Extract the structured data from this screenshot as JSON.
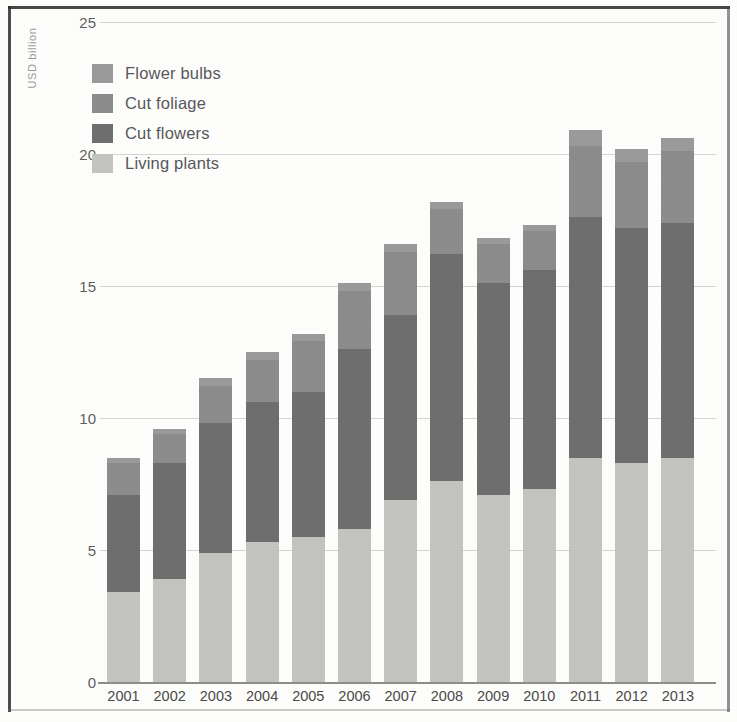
{
  "chart_data": {
    "type": "bar",
    "subtype": "stacked-vertical",
    "title": "",
    "xlabel": "",
    "ylabel": "USD billion",
    "ylim": [
      0,
      25
    ],
    "yticks": [
      0,
      5,
      10,
      15,
      20,
      25
    ],
    "ytick_labels": [
      "0",
      "5",
      "10",
      "15",
      "20",
      "25"
    ],
    "grid": true,
    "legend_position": "top-left",
    "stack_order_bottom_to_top": [
      "Living plants",
      "Cut flowers",
      "Cut foliage",
      "Flower bulbs"
    ],
    "categories": [
      "2001",
      "2002",
      "2003",
      "2004",
      "2005",
      "2006",
      "2007",
      "2008",
      "2009",
      "2010",
      "2011",
      "2012",
      "2013"
    ],
    "series": [
      {
        "name": "Living plants",
        "color": "#c3c3c0",
        "values": [
          3.4,
          3.9,
          4.9,
          5.3,
          5.5,
          5.8,
          6.9,
          7.6,
          7.1,
          7.3,
          8.5,
          8.3,
          8.5
        ]
      },
      {
        "name": "Cut flowers",
        "color": "#6e6e6e",
        "values": [
          3.7,
          4.4,
          4.9,
          5.3,
          5.5,
          6.8,
          7.0,
          8.6,
          8.0,
          8.3,
          9.1,
          8.9,
          8.9
        ]
      },
      {
        "name": "Cut foliage",
        "color": "#8c8c8c",
        "values": [
          1.2,
          1.1,
          1.4,
          1.6,
          1.9,
          2.2,
          2.4,
          1.7,
          1.5,
          1.5,
          2.7,
          2.5,
          2.7
        ]
      },
      {
        "name": "Flower bulbs",
        "color": "#9a9a9a",
        "values": [
          0.2,
          0.2,
          0.3,
          0.3,
          0.3,
          0.3,
          0.3,
          0.3,
          0.2,
          0.2,
          0.6,
          0.5,
          0.5
        ]
      }
    ],
    "totals": [
      8.5,
      9.6,
      11.5,
      12.5,
      13.2,
      15.1,
      16.6,
      18.2,
      16.8,
      17.3,
      20.9,
      20.2,
      20.6
    ]
  },
  "legend": {
    "items": [
      {
        "label": "Flower bulbs",
        "color": "#9a9a9a"
      },
      {
        "label": "Cut foliage",
        "color": "#8c8c8c"
      },
      {
        "label": "Cut flowers",
        "color": "#6e6e6e"
      },
      {
        "label": "Living plants",
        "color": "#c3c3c0"
      }
    ]
  },
  "axis": {
    "y_title": "USD billion",
    "y_ticks": [
      "25",
      "20",
      "15",
      "10",
      "5",
      "0"
    ],
    "x_ticks": [
      "2001",
      "2002",
      "2003",
      "2004",
      "2005",
      "2006",
      "2007",
      "2008",
      "2009",
      "2010",
      "2011",
      "2012",
      "2013"
    ]
  }
}
